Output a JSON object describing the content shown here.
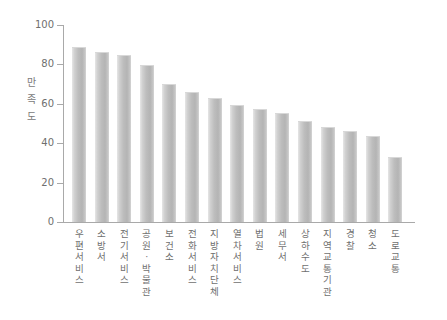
{
  "chart_data": {
    "type": "bar",
    "title": "",
    "subtitle": "",
    "xlabel": "",
    "ylabel": "만족도",
    "ylabel_chars": [
      "만",
      "족",
      "도"
    ],
    "ylim": [
      0,
      100
    ],
    "yticks": [
      0,
      20,
      40,
      60,
      80,
      100
    ],
    "ytick_labels": [
      "0",
      "20",
      "40",
      "60",
      "80",
      "100"
    ],
    "grid": false,
    "legend": null,
    "bar_color": "#bdbdbd",
    "axis_color": "#a9a9a9",
    "text_color": "#6f6f6f",
    "categories": [
      "우편서비스",
      "소방서",
      "전기서비스",
      "공원·박물관",
      "보건소",
      "전화서비스",
      "지방자치단체",
      "열차서비스",
      "법원",
      "세무서",
      "상하수도",
      "지역교통기관",
      "경찰",
      "청소",
      "도로교통"
    ],
    "values": [
      89,
      86.5,
      85,
      79.5,
      70,
      66,
      63,
      59.5,
      57.5,
      55.5,
      51.5,
      48,
      46,
      43.5,
      33
    ]
  }
}
